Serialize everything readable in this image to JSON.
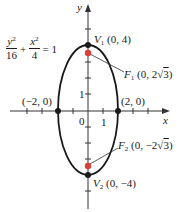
{
  "equation": {
    "term1_num_var": "y",
    "term1_num_exp": "2",
    "term1_den": "16",
    "plus": "+",
    "term2_num_var": "x",
    "term2_num_exp": "2",
    "term2_den": "4",
    "equals": "= 1"
  },
  "axes": {
    "x_label": "x",
    "y_label": "y",
    "origin_label": "0",
    "x_tick_label": "1",
    "y_tick_label": "1"
  },
  "points": {
    "v1": {
      "name": "V",
      "sub": "1",
      "coords": "(0, 4)"
    },
    "v2": {
      "name": "V",
      "sub": "2",
      "coords": "(0, −4)"
    },
    "f1": {
      "name": "F",
      "sub": "1",
      "coords_pre": "(0, 2",
      "radicand": "3",
      "coords_post": ")"
    },
    "f2": {
      "name": "F",
      "sub": "2",
      "coords_pre": "(0, −2",
      "radicand": "3",
      "coords_post": ")"
    },
    "left": {
      "coords": "(−2, 0)"
    },
    "right": {
      "coords": "(2, 0)"
    }
  },
  "colors": {
    "curve": "#1a1a1a",
    "focus": "#d9403a",
    "axis": "#333333"
  }
}
